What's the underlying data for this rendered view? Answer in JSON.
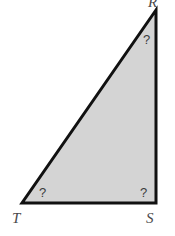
{
  "figure": {
    "type": "right-triangle-diagram",
    "background_color": "#ffffff",
    "fill_color": "#d4d4d4",
    "stroke_color": "#111111",
    "stroke_width": 3,
    "label_color": "#4a4a4a",
    "mark_color": "#3c3c3c",
    "vertices": [
      {
        "name": "R",
        "label": "R",
        "x": 156,
        "y": 10,
        "position": "top-right",
        "clipped": true
      },
      {
        "name": "T",
        "label": "T",
        "x": 22,
        "y": 203,
        "position": "bottom-left",
        "clipped": false
      },
      {
        "name": "S",
        "label": "S",
        "x": 156,
        "y": 203,
        "position": "bottom-right",
        "clipped": false
      }
    ],
    "angle_marks": [
      {
        "at_vertex": "R",
        "label": "?"
      },
      {
        "at_vertex": "T",
        "label": "?"
      },
      {
        "at_vertex": "S",
        "label": "?"
      }
    ],
    "polygon_points": "156,10 22,203 156,203"
  }
}
